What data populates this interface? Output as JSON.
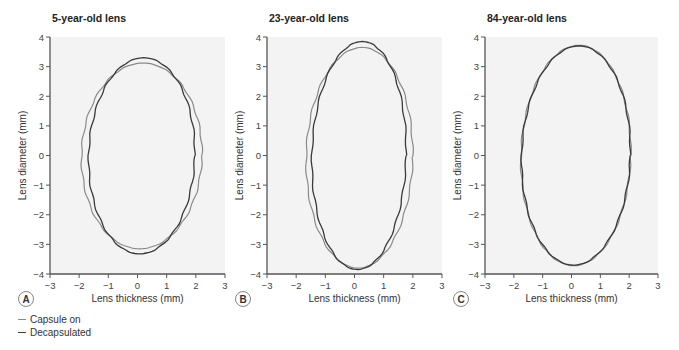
{
  "chart_data": [
    {
      "type": "line",
      "panel": "A",
      "title": "5-year-old lens",
      "xlabel": "Lens thickness (mm)",
      "ylabel": "Lens diameter (mm)",
      "xlim": [
        -3,
        3
      ],
      "ylim": [
        -4,
        4
      ],
      "xticks": [
        -3,
        -2,
        -1,
        0,
        1,
        2,
        3
      ],
      "yticks": [
        -4,
        -3,
        -2,
        -1,
        0,
        1,
        2,
        3,
        4
      ],
      "grid": false,
      "series": [
        {
          "name": "Capsule on",
          "color": "#8a8a8a",
          "center": [
            -0.05,
            0.0
          ],
          "rx": [
            2.05,
            2.08
          ],
          "ry": [
            3.12,
            3.15
          ],
          "tilt": 0.12
        },
        {
          "name": "Decapsulated",
          "color": "#3a3a3a",
          "center": [
            -0.05,
            0.0
          ],
          "rx": [
            1.82,
            1.82
          ],
          "ry": [
            3.3,
            3.32
          ],
          "tilt": 0.15
        }
      ]
    },
    {
      "type": "line",
      "panel": "B",
      "title": "23-year-old lens",
      "xlabel": "Lens thickness (mm)",
      "ylabel": "Lens diameter (mm)",
      "xlim": [
        -3,
        3
      ],
      "ylim": [
        -4,
        4
      ],
      "xticks": [
        -3,
        -2,
        -1,
        0,
        1,
        2,
        3
      ],
      "yticks": [
        -4,
        -3,
        -2,
        -1,
        0,
        1,
        2,
        3,
        4
      ],
      "grid": false,
      "series": [
        {
          "name": "Capsule on",
          "color": "#8a8a8a",
          "center": [
            0.0,
            -0.05
          ],
          "rx": [
            1.85,
            1.8
          ],
          "ry": [
            3.7,
            3.75
          ],
          "tilt": 0.15
        },
        {
          "name": "Decapsulated",
          "color": "#3a3a3a",
          "center": [
            -0.02,
            0.0
          ],
          "rx": [
            1.65,
            1.58
          ],
          "ry": [
            3.85,
            3.85
          ],
          "tilt": 0.18
        }
      ]
    },
    {
      "type": "line",
      "panel": "C",
      "title": "84-year-old lens",
      "xlabel": "Lens thickness (mm)",
      "ylabel": "Lens diameter (mm)",
      "xlim": [
        -3,
        3
      ],
      "ylim": [
        -4,
        4
      ],
      "xticks": [
        -3,
        -2,
        -1,
        0,
        1,
        2,
        3
      ],
      "yticks": [
        -4,
        -3,
        -2,
        -1,
        0,
        1,
        2,
        3,
        4
      ],
      "grid": false,
      "series": [
        {
          "name": "Capsule on",
          "color": "#8a8a8a",
          "center": [
            -0.05,
            0.0
          ],
          "rx": [
            1.92,
            1.88
          ],
          "ry": [
            3.72,
            3.72
          ],
          "tilt": 0.2
        },
        {
          "name": "Decapsulated",
          "color": "#3a3a3a",
          "center": [
            -0.05,
            0.0
          ],
          "rx": [
            1.9,
            1.87
          ],
          "ry": [
            3.7,
            3.7
          ],
          "tilt": 0.2
        }
      ]
    }
  ],
  "legend": {
    "items": [
      {
        "label": "Capsule on",
        "color": "#8a8a8a"
      },
      {
        "label": "Decapsulated",
        "color": "#3a3a3a"
      }
    ]
  },
  "colors": {
    "plot_background": "#f3f3f3",
    "axis": "#555555",
    "badge_border": "#777777"
  }
}
